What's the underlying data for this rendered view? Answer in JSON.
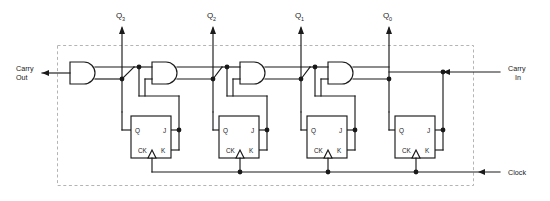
{
  "diagram": {
    "type": "logic-circuit-schematic",
    "boundary": {
      "style": "dashed",
      "color": "#b4b4b4"
    },
    "line_color": "#1a1a1a",
    "background": "#ffffff"
  },
  "io": {
    "carry_out": {
      "label_line1": "Carry",
      "label_line2": "Out",
      "direction": "left",
      "side": "left"
    },
    "carry_in": {
      "label_line1": "Carry",
      "label_line2": "In",
      "direction": "left",
      "side": "right"
    },
    "clock": {
      "label": "Clock",
      "direction": "left",
      "side": "right"
    }
  },
  "outputs": [
    {
      "name": "Q3",
      "base": "Q",
      "sub": "3",
      "x": 122
    },
    {
      "name": "Q2",
      "base": "Q",
      "sub": "2",
      "x": 213
    },
    {
      "name": "Q1",
      "base": "Q",
      "sub": "1",
      "x": 301
    },
    {
      "name": "Q0",
      "base": "Q",
      "sub": "0",
      "x": 389
    }
  ],
  "flipflops": [
    {
      "id": "ff3",
      "pins": {
        "q": "Q",
        "j": "J",
        "ck": "CK",
        "k": "K"
      },
      "x": 131
    },
    {
      "id": "ff2",
      "pins": {
        "q": "Q",
        "j": "J",
        "ck": "CK",
        "k": "K"
      },
      "x": 219
    },
    {
      "id": "ff1",
      "pins": {
        "q": "Q",
        "j": "J",
        "ck": "CK",
        "k": "K"
      },
      "x": 307
    },
    {
      "id": "ff0",
      "pins": {
        "q": "Q",
        "j": "J",
        "ck": "CK",
        "k": "K"
      },
      "x": 395
    }
  ],
  "gates": [
    {
      "id": "and3",
      "type": "AND",
      "inputs": 2,
      "x": 70
    },
    {
      "id": "and2",
      "type": "AND",
      "inputs": 2,
      "x": 152
    },
    {
      "id": "and1",
      "type": "AND",
      "inputs": 2,
      "x": 240
    },
    {
      "id": "and0",
      "type": "AND",
      "inputs": 2,
      "x": 328
    }
  ]
}
